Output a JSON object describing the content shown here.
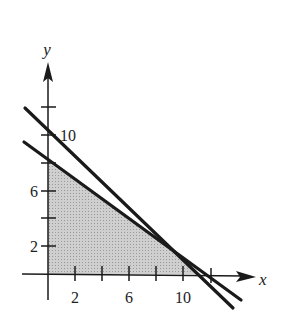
{
  "figure": {
    "axes": {
      "x_label": "x",
      "y_label": "y",
      "x_tick_labels": [
        "2",
        "6",
        "10"
      ],
      "y_tick_labels": [
        "2",
        "6",
        "10"
      ]
    },
    "colors": {
      "line": "#1a1a1a",
      "shade": "#c8c8c8",
      "background": "#ffffff"
    },
    "lines": [
      {
        "name": "upper-line",
        "y_intercept": 10,
        "x_intercept": 11
      },
      {
        "name": "lower-line",
        "y_intercept": 8,
        "x_intercept": 12
      }
    ],
    "feasible_region": {
      "vertices": [
        [
          0,
          0
        ],
        [
          0,
          8
        ],
        [
          8.25,
          2.5
        ],
        [
          11,
          0
        ]
      ],
      "description": "shaded region below both lines in first quadrant"
    }
  }
}
